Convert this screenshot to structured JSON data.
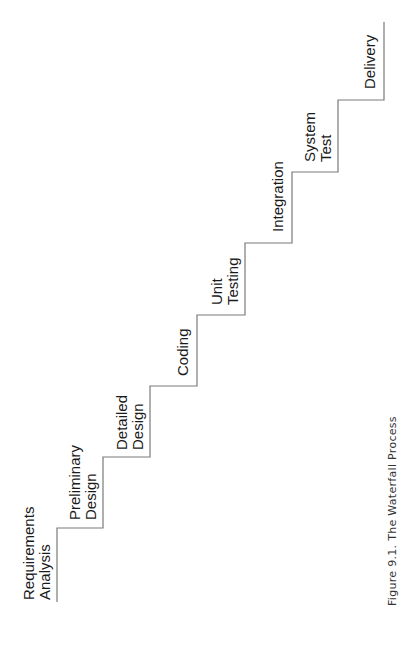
{
  "figure": {
    "caption": "Figure 9.1.  The Waterfall Process",
    "caption_prefix": "Figure 9.1.",
    "caption_title": "The Waterfall Process",
    "orientation": "rotated -90deg (landscape on portrait page)"
  },
  "phases": [
    {
      "line1": "Requirements",
      "line2": "Analysis"
    },
    {
      "line1": "Preliminary",
      "line2": "Design"
    },
    {
      "line1": "Detailed",
      "line2": "Design"
    },
    {
      "line1": "Coding",
      "line2": ""
    },
    {
      "line1": "Unit",
      "line2": "Testing"
    },
    {
      "line1": "Integration",
      "line2": ""
    },
    {
      "line1": "System",
      "line2": "Test"
    },
    {
      "line1": "Delivery",
      "line2": ""
    }
  ],
  "colors": {
    "line": "#7a7a7a",
    "text": "#1a1a1a",
    "background": "#ffffff"
  }
}
